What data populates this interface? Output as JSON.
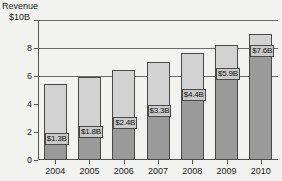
{
  "axis": {
    "y_title": "Revenue",
    "y_top_label": "$10B",
    "y_ticks": [
      "8",
      "6",
      "4",
      "2",
      "0"
    ],
    "y_tick_values": [
      8,
      6,
      4,
      2,
      0
    ]
  },
  "chart_data": {
    "type": "bar",
    "title": "",
    "subtitle": "",
    "xlabel": "",
    "ylabel": "Revenue",
    "ylim": [
      0,
      10
    ],
    "y_unit": "$B",
    "grid": true,
    "legend": "none",
    "stacked": true,
    "categories": [
      "2004",
      "2005",
      "2006",
      "2007",
      "2008",
      "2009",
      "2010"
    ],
    "series": [
      {
        "name": "Labeled segment",
        "color": "#9a9a9a",
        "values": [
          1.3,
          1.8,
          2.4,
          3.3,
          4.4,
          5.9,
          7.6
        ]
      },
      {
        "name": "Remaining segment",
        "color": "#d2d2d2",
        "values": [
          4.1,
          4.1,
          4.0,
          3.7,
          3.25,
          2.35,
          1.4
        ]
      }
    ],
    "totals": [
      5.4,
      5.9,
      6.4,
      7.0,
      7.65,
      8.25,
      9.0
    ],
    "data_labels": [
      "$1.3B",
      "$1.8B",
      "$2.4B",
      "$3.3B",
      "$4.4B",
      "$5.9B",
      "$7.6B"
    ],
    "annotations": []
  },
  "bars": [
    {
      "year": "2004",
      "label": "$1.3B",
      "lower": 1.3,
      "total": 5.4
    },
    {
      "year": "2005",
      "label": "$1.8B",
      "lower": 1.8,
      "total": 5.9
    },
    {
      "year": "2006",
      "label": "$2.4B",
      "lower": 2.4,
      "total": 6.4
    },
    {
      "year": "2007",
      "label": "$3.3B",
      "lower": 3.3,
      "total": 7.0
    },
    {
      "year": "2008",
      "label": "$4.4B",
      "lower": 4.4,
      "total": 7.65
    },
    {
      "year": "2009",
      "label": "$5.9B",
      "lower": 5.9,
      "total": 8.25
    },
    {
      "year": "2010",
      "label": "$7.6B",
      "lower": 7.6,
      "total": 9.0
    }
  ],
  "colors": {
    "lower_segment": "#9a9a9a",
    "upper_segment": "#d2d2d2",
    "outline": "#4a4a4a",
    "gridline": "#6b6b6b",
    "background": "#f2f2f0",
    "text": "#1a1a1a",
    "label_bg": "#c9c9c9"
  }
}
